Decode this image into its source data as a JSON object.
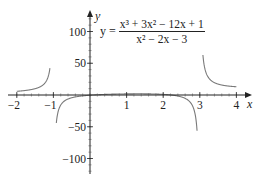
{
  "chart_data": {
    "type": "line",
    "title": "",
    "equation": {
      "lhs": "y =",
      "numerator": "x³ + 3x² − 12x + 1",
      "denominator": "x² − 2x − 3"
    },
    "function": "(x^3 + 3x^2 - 12x + 1) / (x^2 - 2x - 3)",
    "xlabel": "x",
    "ylabel": "y",
    "xlim": [
      -2.1,
      4.3
    ],
    "ylim": [
      -120,
      130
    ],
    "x_ticks": [
      -2,
      -1,
      1,
      2,
      3,
      4
    ],
    "x_tick_labels": [
      "−2",
      "−1",
      "1",
      "2",
      "3",
      "4"
    ],
    "y_ticks": [
      100,
      50,
      -50,
      -100
    ],
    "y_tick_labels": [
      "100",
      "50",
      "−50",
      "−100"
    ],
    "vertical_asymptotes": [
      -1,
      3
    ],
    "grid": false,
    "legend": null,
    "series": [
      {
        "name": "y = (x³+3x²−12x+1)/(x²−2x−3)",
        "branches": [
          {
            "x": [
              -2.0,
              -1.8,
              -1.6,
              -1.4,
              -1.3,
              -1.2,
              -1.15,
              -1.1
            ],
            "y": [
              5.0,
              6.3,
              8.5,
              13.2,
              18.4,
              28.9,
              38.9,
              59.5
            ]
          },
          {
            "x": [
              -0.9,
              -0.8,
              -0.6,
              -0.4,
              -0.2,
              0.0,
              0.5,
              1.0,
              1.5,
              2.0,
              2.5,
              2.7,
              2.8,
              2.9
            ],
            "y": [
              -117.1,
              -56.1,
              -22.1,
              -10.0,
              -3.9,
              -0.33,
              1.47,
              1.75,
              0.81,
              -1.67,
              -8.5,
              -20.5,
              -36.3,
              -83.7
            ]
          },
          {
            "x": [
              3.1,
              3.2,
              3.4,
              3.6,
              3.8,
              4.0
            ],
            "y": [
              119.3,
              60.9,
              32.0,
              22.2,
              17.5,
              14.6
            ]
          }
        ]
      }
    ],
    "line_color": "#7a7a7a",
    "axis_color": "#222222"
  }
}
